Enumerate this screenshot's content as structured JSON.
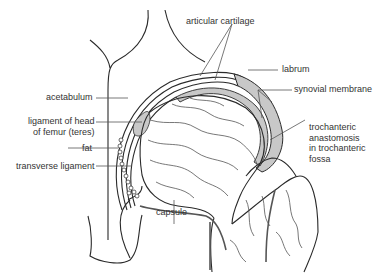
{
  "diagram": {
    "colors": {
      "outline": "#2a2a2a",
      "cartilage": "#c8c8c8",
      "vessel": "#555555",
      "leader": "#555555",
      "text": "#333333",
      "background": "#ffffff"
    },
    "labels": {
      "articular_cartilage": "articular cartilage",
      "labrum": "labrum",
      "synovial_membrane": "synovial membrane",
      "acetabulum": "acetabulum",
      "ligament_head_line1": "ligament of head",
      "ligament_head_line2": "of femur (teres)",
      "fat": "fat",
      "transverse_ligament": "transverse ligament",
      "trochanteric_line1": "trochanteric",
      "trochanteric_line2": "anastomosis",
      "trochanteric_line3": "in trochanteric",
      "trochanteric_line4": "fossa",
      "capsule": "capsule"
    }
  }
}
